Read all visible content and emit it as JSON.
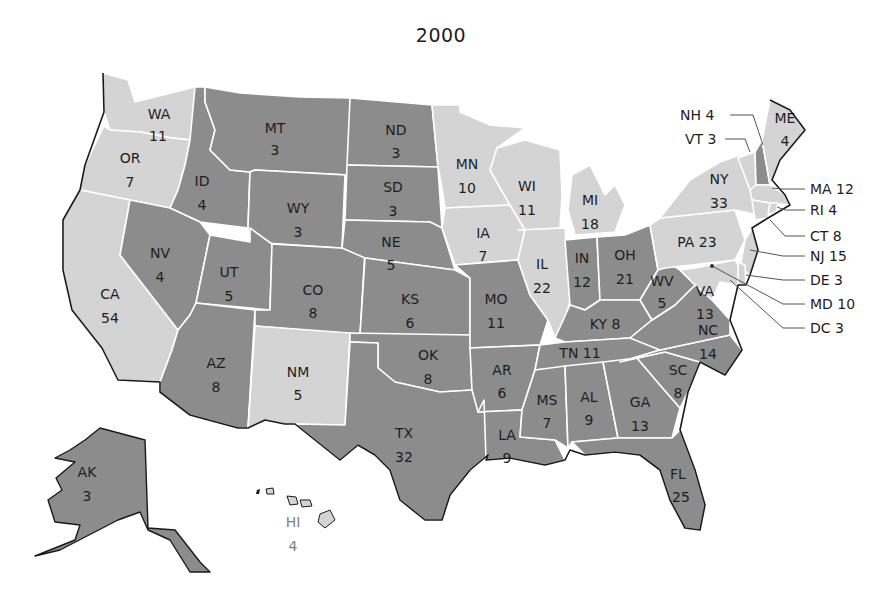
{
  "title": "2000",
  "colors": {
    "dark_fill": "#8c8c8c",
    "light_fill": "#d4d4d4",
    "border": "#ffffff",
    "coastline": "#1a1a1a",
    "text": "#1e1e1e",
    "hawaii_label": "#808080"
  },
  "states": [
    {
      "abbr": "WA",
      "votes": "11",
      "shade": "light"
    },
    {
      "abbr": "OR",
      "votes": "7",
      "shade": "light"
    },
    {
      "abbr": "CA",
      "votes": "54",
      "shade": "light"
    },
    {
      "abbr": "ID",
      "votes": "4",
      "shade": "dark"
    },
    {
      "abbr": "NV",
      "votes": "4",
      "shade": "dark"
    },
    {
      "abbr": "MT",
      "votes": "3",
      "shade": "dark"
    },
    {
      "abbr": "WY",
      "votes": "3",
      "shade": "dark"
    },
    {
      "abbr": "UT",
      "votes": "5",
      "shade": "dark"
    },
    {
      "abbr": "AZ",
      "votes": "8",
      "shade": "dark"
    },
    {
      "abbr": "CO",
      "votes": "8",
      "shade": "dark"
    },
    {
      "abbr": "NM",
      "votes": "5",
      "shade": "light"
    },
    {
      "abbr": "ND",
      "votes": "3",
      "shade": "dark"
    },
    {
      "abbr": "SD",
      "votes": "3",
      "shade": "dark"
    },
    {
      "abbr": "NE",
      "votes": "5",
      "shade": "dark"
    },
    {
      "abbr": "KS",
      "votes": "6",
      "shade": "dark"
    },
    {
      "abbr": "OK",
      "votes": "8",
      "shade": "dark"
    },
    {
      "abbr": "TX",
      "votes": "32",
      "shade": "dark"
    },
    {
      "abbr": "MN",
      "votes": "10",
      "shade": "light"
    },
    {
      "abbr": "IA",
      "votes": "7",
      "shade": "light"
    },
    {
      "abbr": "MO",
      "votes": "11",
      "shade": "dark"
    },
    {
      "abbr": "AR",
      "votes": "6",
      "shade": "dark"
    },
    {
      "abbr": "LA",
      "votes": "9",
      "shade": "dark"
    },
    {
      "abbr": "WI",
      "votes": "11",
      "shade": "light"
    },
    {
      "abbr": "IL",
      "votes": "22",
      "shade": "light"
    },
    {
      "abbr": "MI",
      "votes": "18",
      "shade": "light"
    },
    {
      "abbr": "IN",
      "votes": "12",
      "shade": "dark"
    },
    {
      "abbr": "OH",
      "votes": "21",
      "shade": "dark"
    },
    {
      "abbr": "KY",
      "votes": "8",
      "shade": "dark"
    },
    {
      "abbr": "TN",
      "votes": "11",
      "shade": "dark"
    },
    {
      "abbr": "MS",
      "votes": "7",
      "shade": "dark"
    },
    {
      "abbr": "AL",
      "votes": "9",
      "shade": "dark"
    },
    {
      "abbr": "GA",
      "votes": "13",
      "shade": "dark"
    },
    {
      "abbr": "FL",
      "votes": "25",
      "shade": "dark"
    },
    {
      "abbr": "SC",
      "votes": "8",
      "shade": "dark"
    },
    {
      "abbr": "NC",
      "votes": "14",
      "shade": "dark"
    },
    {
      "abbr": "VA",
      "votes": "13",
      "shade": "dark"
    },
    {
      "abbr": "WV",
      "votes": "5",
      "shade": "dark"
    },
    {
      "abbr": "PA",
      "votes": "23",
      "shade": "light"
    },
    {
      "abbr": "NY",
      "votes": "33",
      "shade": "light"
    },
    {
      "abbr": "VT",
      "votes": "3",
      "shade": "light"
    },
    {
      "abbr": "NH",
      "votes": "4",
      "shade": "dark"
    },
    {
      "abbr": "ME",
      "votes": "4",
      "shade": "light"
    },
    {
      "abbr": "MA",
      "votes": "12",
      "shade": "light"
    },
    {
      "abbr": "RI",
      "votes": "4",
      "shade": "light"
    },
    {
      "abbr": "CT",
      "votes": "8",
      "shade": "light"
    },
    {
      "abbr": "NJ",
      "votes": "15",
      "shade": "light"
    },
    {
      "abbr": "DE",
      "votes": "3",
      "shade": "light"
    },
    {
      "abbr": "MD",
      "votes": "10",
      "shade": "light"
    },
    {
      "abbr": "DC",
      "votes": "3",
      "shade": "light"
    },
    {
      "abbr": "AK",
      "votes": "3",
      "shade": "dark"
    },
    {
      "abbr": "HI",
      "votes": "4",
      "shade": "light"
    }
  ],
  "labels": {
    "WA": "WA",
    "WA_v": "11",
    "OR": "OR",
    "OR_v": "7",
    "CA": "CA",
    "CA_v": "54",
    "ID": "ID",
    "ID_v": "4",
    "NV": "NV",
    "NV_v": "4",
    "MT": "MT",
    "MT_v": "3",
    "WY": "WY",
    "WY_v": "3",
    "UT": "UT",
    "UT_v": "5",
    "AZ": "AZ",
    "AZ_v": "8",
    "CO": "CO",
    "CO_v": "8",
    "NM": "NM",
    "NM_v": "5",
    "ND": "ND",
    "ND_v": "3",
    "SD": "SD",
    "SD_v": "3",
    "NE": "NE",
    "NE_v": "5",
    "KS": "KS",
    "KS_v": "6",
    "OK": "OK",
    "OK_v": "8",
    "TX": "TX",
    "TX_v": "32",
    "MN": "MN",
    "MN_v": "10",
    "IA": "IA",
    "IA_v": "7",
    "MO": "MO",
    "MO_v": "11",
    "AR": "AR",
    "AR_v": "6",
    "LA": "LA",
    "LA_v": "9",
    "WI": "WI",
    "WI_v": "11",
    "IL": "IL",
    "IL_v": "22",
    "MI": "MI",
    "MI_v": "18",
    "IN": "IN",
    "IN_v": "12",
    "OH": "OH",
    "OH_v": "21",
    "KY": "KY 8",
    "TN": "TN 11",
    "MS": "MS",
    "MS_v": "7",
    "AL": "AL",
    "AL_v": "9",
    "GA": "GA",
    "GA_v": "13",
    "FL": "FL",
    "FL_v": "25",
    "SC": "SC",
    "SC_v": "8",
    "NC": "NC",
    "NC_v": "14",
    "VA": "VA",
    "VA_v": "13",
    "WV": "WV",
    "WV_v": "5",
    "PA": "PA 23",
    "NY": "NY",
    "NY_v": "33",
    "ME": "ME",
    "ME_v": "4",
    "AK": "AK",
    "AK_v": "3",
    "HI": "HI",
    "HI_v": "4",
    "NH_ext": "NH 4",
    "VT_ext": "VT 3",
    "MA_ext": "MA 12",
    "RI_ext": "RI 4",
    "CT_ext": "CT 8",
    "NJ_ext": "NJ 15",
    "DE_ext": "DE 3",
    "MD_ext": "MD 10",
    "DC_ext": "DC 3"
  }
}
